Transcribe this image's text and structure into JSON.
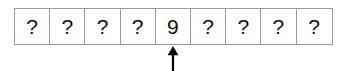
{
  "diagram": {
    "type": "array-cells-with-pointer",
    "title": "",
    "cell_count": 9,
    "cells": [
      {
        "index": 0,
        "value": "?"
      },
      {
        "index": 1,
        "value": "?"
      },
      {
        "index": 2,
        "value": "?"
      },
      {
        "index": 3,
        "value": "?"
      },
      {
        "index": 4,
        "value": "9"
      },
      {
        "index": 5,
        "value": "?"
      },
      {
        "index": 6,
        "value": "?"
      },
      {
        "index": 7,
        "value": "?"
      },
      {
        "index": 8,
        "value": "?"
      }
    ],
    "pointer": {
      "icon": "arrow-up-icon",
      "target_cell_index": 4,
      "target_cell_value": "9",
      "label": ""
    },
    "colors": {
      "border": "#9a9a9a",
      "cell_background": "#ffffff",
      "text": "#111111",
      "pointer": "#000000",
      "page_background": "#ffffff"
    }
  }
}
